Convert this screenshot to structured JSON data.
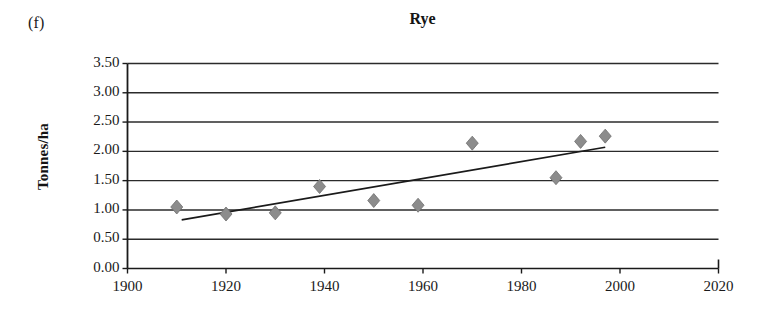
{
  "figure": {
    "panel_label": "(f)",
    "title": "Rye"
  },
  "chart_data": {
    "type": "scatter",
    "title": "Rye",
    "panel_label": "(f)",
    "xlabel": "",
    "ylabel": "Tonnes/ha",
    "xlim": [
      1900,
      2020
    ],
    "ylim": [
      0.0,
      3.5
    ],
    "xticks": [
      1900,
      1920,
      1940,
      1960,
      1980,
      2000,
      2020
    ],
    "xtick_labels": [
      "1900",
      "1920",
      "1940",
      "1960",
      "1980",
      "2000",
      "2020"
    ],
    "yticks": [
      0.0,
      0.5,
      1.0,
      1.5,
      2.0,
      2.5,
      3.0,
      3.5
    ],
    "ytick_labels": [
      "0.00",
      "0.50",
      "1.00",
      "1.50",
      "2.00",
      "2.50",
      "3.00",
      "3.50"
    ],
    "grid": "horizontal",
    "legend": "none",
    "marker": "diamond",
    "marker_color": "#8c8c8c",
    "series": [
      {
        "name": "Rye yield",
        "x": [
          1910,
          1920,
          1930,
          1939,
          1950,
          1959,
          1970,
          1987,
          1992,
          1997
        ],
        "y": [
          1.05,
          0.93,
          0.95,
          1.4,
          1.16,
          1.08,
          2.14,
          1.55,
          2.17,
          2.26
        ]
      }
    ],
    "trendline": {
      "type": "linear",
      "color": "#1a1a1a",
      "x": [
        1911,
        1997
      ],
      "y": [
        0.83,
        2.07
      ]
    }
  },
  "axis_title": {
    "y": "Tonnes/ha"
  },
  "colors": {
    "marker": "#8c8c8c",
    "marker_edge": "#6e6e6e",
    "trendline": "#1a1a1a",
    "axis": "#1a1a1a",
    "gridline": "#2b2b2b",
    "background": "#ffffff"
  }
}
